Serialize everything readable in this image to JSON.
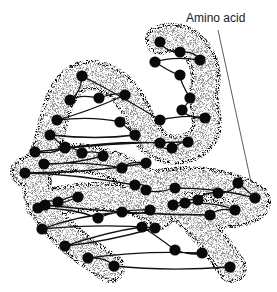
{
  "diagram": {
    "labels": [
      {
        "text": "Amino acid",
        "pointer_from": [
          218,
          30
        ],
        "pointer_to": [
          251,
          182
        ]
      }
    ],
    "colors": {
      "stipple": "#2a2a2a",
      "chain": "#111111",
      "amino_acid": "#0a0a0a",
      "background": "#ffffff"
    },
    "tube_path": "M160 40 C185 30 210 55 205 85 C200 110 215 125 200 140 C185 155 160 150 150 140 M82 76 C60 85 55 115 50 135 C45 160 30 175 40 200 C50 225 75 245 110 268 M82 76 C105 70 130 90 140 120 C150 140 160 150 175 150 M25 172 C60 150 110 150 170 200 C200 220 220 250 232 268 M40 205 C80 195 130 190 160 215 M140 185 C170 185 200 170 255 198 C262 210 230 218 200 212 C180 205 150 195 120 168",
    "amino_acids": [
      [
        160,
        42
      ],
      [
        180,
        52
      ],
      [
        200,
        60
      ],
      [
        155,
        62
      ],
      [
        180,
        75
      ],
      [
        190,
        98
      ],
      [
        182,
        110
      ],
      [
        205,
        118
      ],
      [
        160,
        120
      ],
      [
        82,
        76
      ],
      [
        70,
        100
      ],
      [
        99,
        98
      ],
      [
        125,
        95
      ],
      [
        57,
        120
      ],
      [
        120,
        122
      ],
      [
        135,
        135
      ],
      [
        50,
        135
      ],
      [
        65,
        148
      ],
      [
        160,
        143
      ],
      [
        172,
        148
      ],
      [
        188,
        142
      ],
      [
        35,
        152
      ],
      [
        65,
        147
      ],
      [
        82,
        153
      ],
      [
        103,
        156
      ],
      [
        44,
        164
      ],
      [
        122,
        168
      ],
      [
        146,
        163
      ],
      [
        25,
        173
      ],
      [
        135,
        185
      ],
      [
        146,
        190
      ],
      [
        175,
        188
      ],
      [
        255,
        198
      ],
      [
        238,
        183
      ],
      [
        218,
        193
      ],
      [
        198,
        200
      ],
      [
        173,
        205
      ],
      [
        185,
        203
      ],
      [
        235,
        210
      ],
      [
        210,
        215
      ],
      [
        45,
        205
      ],
      [
        58,
        202
      ],
      [
        78,
        197
      ],
      [
        38,
        208
      ],
      [
        98,
        218
      ],
      [
        150,
        210
      ],
      [
        122,
        212
      ],
      [
        42,
        229
      ],
      [
        155,
        228
      ],
      [
        65,
        246
      ],
      [
        142,
        227
      ],
      [
        175,
        250
      ],
      [
        202,
        253
      ],
      [
        88,
        258
      ],
      [
        114,
        266
      ],
      [
        230,
        267
      ]
    ]
  }
}
